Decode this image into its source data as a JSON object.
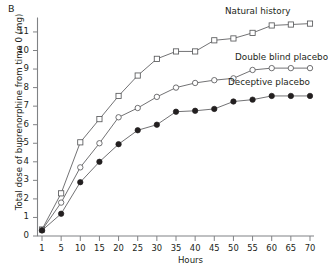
{
  "figure": {
    "panel_letter": "B",
    "xlabel": "Hours",
    "ylabel": "Total dose of buprenorphine from time 0 (mg)"
  },
  "chart_data": {
    "type": "line",
    "title": "",
    "panel": "B",
    "xlabel": "Hours",
    "ylabel": "Total dose of buprenorphine from time 0 (mg)",
    "x": [
      1,
      5,
      10,
      15,
      20,
      25,
      30,
      35,
      40,
      45,
      50,
      55,
      60,
      65,
      70
    ],
    "xticklabels": [
      "1",
      "5",
      "10",
      "15",
      "20",
      "25",
      "30",
      "35",
      "40",
      "45",
      "50",
      "55",
      "60",
      "65",
      "70"
    ],
    "yticklabels": [
      "0",
      "1",
      "2",
      "3",
      "4",
      "5",
      "6",
      "7",
      "8",
      "9",
      "10",
      "11"
    ],
    "xlim": [
      1,
      70
    ],
    "ylim": [
      0,
      11.8
    ],
    "grid": false,
    "legend_position": "inline-right",
    "series": [
      {
        "name": "Natural history",
        "marker": "open-square",
        "label_x_px": 225,
        "label_y_px": 6,
        "values": [
          0.35,
          2.3,
          5.05,
          6.3,
          7.55,
          8.65,
          9.55,
          9.95,
          9.95,
          10.55,
          10.65,
          10.95,
          11.35,
          11.4,
          11.45
        ]
      },
      {
        "name": "Double blind placebo",
        "marker": "open-circle",
        "label_x_px": 235,
        "label_y_px": 52,
        "values": [
          0.32,
          1.8,
          3.7,
          5.0,
          6.4,
          6.9,
          7.5,
          8.0,
          8.25,
          8.4,
          8.5,
          8.95,
          9.05,
          9.05,
          9.05
        ]
      },
      {
        "name": "Deceptive placebo",
        "marker": "filled-circle",
        "label_x_px": 228,
        "label_y_px": 77,
        "values": [
          0.3,
          1.2,
          2.9,
          4.0,
          4.95,
          5.7,
          6.0,
          6.7,
          6.75,
          6.85,
          7.25,
          7.35,
          7.55,
          7.55,
          7.55
        ]
      }
    ]
  }
}
